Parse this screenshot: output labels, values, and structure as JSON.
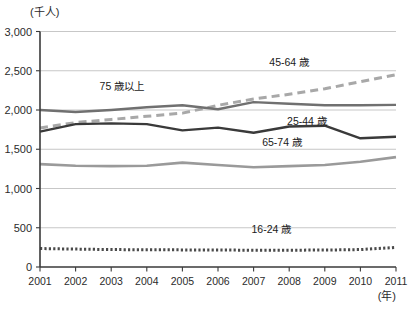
{
  "chart_data": {
    "type": "line",
    "title": "",
    "subtitle": "",
    "xlabel": "(年)",
    "ylabel": "(千人)",
    "x": [
      2001,
      2002,
      2003,
      2004,
      2005,
      2006,
      2007,
      2008,
      2009,
      2010,
      2011
    ],
    "xtick_labels": [
      "2001",
      "2002",
      "2003",
      "2004",
      "2005",
      "2006",
      "2007",
      "2008",
      "2009",
      "2010",
      "2011"
    ],
    "ytick_labels": [
      "0",
      "500",
      "1,000",
      "1,500",
      "2,000",
      "2,500",
      "3,000"
    ],
    "ytick_values": [
      0,
      500,
      1000,
      1500,
      2000,
      2500,
      3000
    ],
    "ylim": [
      0,
      3000
    ],
    "xlim": [
      2001,
      2011
    ],
    "grid": true,
    "legend_position": "inline-annotations",
    "series": [
      {
        "name": "45-64 歳",
        "style": "dashed",
        "color": "#a8a8a8",
        "width": 3,
        "label_x": 2008.0,
        "label_y": 2560,
        "values": [
          1770,
          1840,
          1880,
          1920,
          1960,
          2060,
          2140,
          2200,
          2270,
          2360,
          2450
        ]
      },
      {
        "name": "75 歳以上",
        "style": "solid",
        "color": "#707070",
        "width": 2.4,
        "label_x": 2003.3,
        "label_y": 2250,
        "values": [
          2000,
          1975,
          2000,
          2035,
          2060,
          2010,
          2100,
          2080,
          2060,
          2060,
          2065
        ]
      },
      {
        "name": "25-44 歳",
        "style": "solid",
        "color": "#3a3a3a",
        "width": 2.4,
        "label_x": 2008.5,
        "label_y": 1810,
        "values": [
          1725,
          1820,
          1830,
          1820,
          1740,
          1775,
          1710,
          1790,
          1800,
          1640,
          1660
        ]
      },
      {
        "name": "65-74 歳",
        "style": "solid",
        "color": "#9a9a9a",
        "width": 2.6,
        "label_x": 2007.8,
        "label_y": 1540,
        "values": [
          1310,
          1290,
          1285,
          1290,
          1330,
          1300,
          1270,
          1285,
          1300,
          1340,
          1400
        ]
      },
      {
        "name": "16-24 歳",
        "style": "dotted",
        "color": "#4a4a4a",
        "width": 3,
        "label_x": 2007.5,
        "label_y": 430,
        "values": [
          235,
          228,
          222,
          220,
          218,
          216,
          214,
          214,
          216,
          222,
          250
        ]
      }
    ]
  }
}
